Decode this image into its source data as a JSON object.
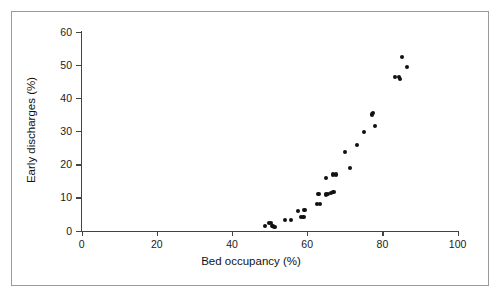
{
  "figure": {
    "border_color": "#9a9a9a",
    "background": "#ffffff",
    "point_color": "#111111",
    "axis_color": "#444444"
  },
  "chart_data": {
    "type": "scatter",
    "title": "",
    "xlabel": "Bed occupancy (%)",
    "ylabel": "Early discharges (%)",
    "xlim": [
      0,
      100
    ],
    "ylim": [
      0,
      60
    ],
    "xticks": [
      0,
      20,
      40,
      60,
      80,
      100
    ],
    "yticks": [
      0,
      10,
      20,
      30,
      40,
      50,
      60
    ],
    "xtick_labels": [
      "0",
      "20",
      "40",
      "60",
      "80",
      "100"
    ],
    "ytick_labels": [
      "0",
      "10",
      "20",
      "30",
      "40",
      "50",
      "60"
    ],
    "grid": false,
    "legend": null,
    "marker": "circle",
    "series": [
      {
        "name": "hospitals",
        "points": [
          [
            48.8,
            1.3
          ],
          [
            49.8,
            2.2
          ],
          [
            50.3,
            2.3
          ],
          [
            50.6,
            1.5
          ],
          [
            51.0,
            1.4
          ],
          [
            51.3,
            1.2
          ],
          [
            54.0,
            3.1
          ],
          [
            55.6,
            3.1
          ],
          [
            57.5,
            6.0
          ],
          [
            58.4,
            4.2
          ],
          [
            59.0,
            4.2
          ],
          [
            59.3,
            6.1
          ],
          [
            62.7,
            8.1
          ],
          [
            63.0,
            11.0
          ],
          [
            63.4,
            8.1
          ],
          [
            65.0,
            10.9
          ],
          [
            65.6,
            11.0
          ],
          [
            66.3,
            11.3
          ],
          [
            67.0,
            11.7
          ],
          [
            66.9,
            16.9
          ],
          [
            67.7,
            16.9
          ],
          [
            64.9,
            15.9
          ],
          [
            70.0,
            23.7
          ],
          [
            71.4,
            18.9
          ],
          [
            73.3,
            25.9
          ],
          [
            75.0,
            29.8
          ],
          [
            77.3,
            35.0
          ],
          [
            77.4,
            35.5
          ],
          [
            78.0,
            31.6
          ],
          [
            83.3,
            46.4
          ],
          [
            84.5,
            46.2
          ],
          [
            84.6,
            45.8
          ],
          [
            85.2,
            52.4
          ],
          [
            86.5,
            49.4
          ]
        ]
      }
    ]
  }
}
